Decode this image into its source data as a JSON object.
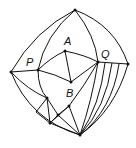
{
  "diagram": {
    "type": "planar-graph",
    "labels": {
      "A": "A",
      "B": "B",
      "P": "P",
      "Q": "Q"
    },
    "colors": {
      "stroke": "#111111",
      "background": "#ffffff"
    }
  }
}
